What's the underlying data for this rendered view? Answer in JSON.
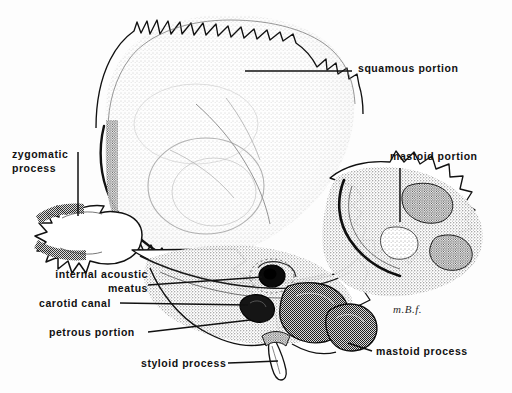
{
  "figure": {
    "signature": "m.B.f.",
    "ink_color": "#111111",
    "paper_color": "#fdfdfd",
    "stipple_color": "#2a2a2a"
  },
  "labels": [
    {
      "id": "squamous-portion",
      "text": "squamous portion",
      "x": 358,
      "y": 62,
      "align": "left"
    },
    {
      "id": "mastoid-portion",
      "text": "mastoid portion",
      "x": 390,
      "y": 150,
      "align": "left"
    },
    {
      "id": "zygomatic-process",
      "text": "zygomatic\nprocess",
      "x": 12,
      "y": 148,
      "align": "left"
    },
    {
      "id": "internal-acoustic-meatus",
      "text": "internal acoustic\nmeatus",
      "x": 18,
      "y": 268,
      "align": "left"
    },
    {
      "id": "carotid-canal",
      "text": "carotid canal",
      "x": 39,
      "y": 302,
      "align": "left"
    },
    {
      "id": "petrous-portion",
      "text": "petrous portion",
      "x": 49,
      "y": 330,
      "align": "left"
    },
    {
      "id": "styloid-process",
      "text": "styloid process",
      "x": 141,
      "y": 362,
      "align": "left"
    },
    {
      "id": "mastoid-process",
      "text": "mastoid process",
      "x": 376,
      "y": 350,
      "align": "left"
    }
  ],
  "leader_lines": [
    {
      "id": "leader-squamous",
      "x1": 245,
      "y1": 71,
      "x2": 352,
      "y2": 71
    },
    {
      "id": "leader-mastoid-portion",
      "x1": 400,
      "y1": 168,
      "x2": 400,
      "y2": 222
    },
    {
      "id": "leader-zygomatic",
      "x1": 78,
      "y1": 152,
      "x2": 78,
      "y2": 216
    },
    {
      "id": "leader-iam",
      "x1": 148,
      "y1": 285,
      "x2": 262,
      "y2": 277
    },
    {
      "id": "leader-carotid",
      "x1": 120,
      "y1": 303,
      "x2": 248,
      "y2": 305
    },
    {
      "id": "leader-petrous",
      "x1": 148,
      "y1": 332,
      "x2": 250,
      "y2": 320
    },
    {
      "id": "leader-styloid",
      "x1": 228,
      "y1": 363,
      "x2": 282,
      "y2": 362
    },
    {
      "id": "leader-mastoid-process",
      "x1": 348,
      "y1": 343,
      "x2": 372,
      "y2": 351
    }
  ],
  "structures": [
    {
      "id": "squamous-portion",
      "note": "fan-shaped plate with serrated superior border"
    },
    {
      "id": "petrous-portion",
      "note": "pyramidal ridge running antero-medially"
    },
    {
      "id": "mastoid-portion",
      "note": "rough posterior block of bone"
    },
    {
      "id": "zygomatic-process",
      "note": "jagged anterior projection at left"
    },
    {
      "id": "internal-acoustic-meatus",
      "note": "dark oval foramen on posterior petrous face"
    },
    {
      "id": "carotid-canal",
      "note": "opening inferior to the meatus"
    },
    {
      "id": "styloid-process",
      "note": "slender inferior spike"
    },
    {
      "id": "mastoid-process",
      "note": "blunt inferior projection of mastoid portion"
    }
  ]
}
